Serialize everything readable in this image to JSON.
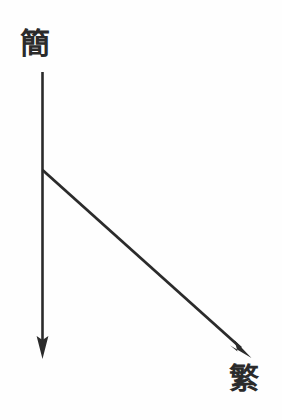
{
  "diagram": {
    "type": "hand-drawn-branching-arrow",
    "background_color": "#fefefe",
    "ink_color": "#2b2b2b",
    "labels": {
      "source": "簡",
      "target": "繁"
    },
    "arrows": [
      {
        "id": "main-vertical-arrow",
        "name": "vertical-arrow",
        "from_label": "簡",
        "start": {
          "x": 42,
          "y": 72
        },
        "end": {
          "x": 42,
          "y": 358
        },
        "direction": "down",
        "head": "filled-triangle"
      },
      {
        "id": "branch-diagonal-arrow",
        "name": "diagonal-arrow",
        "to_label": "繁",
        "start": {
          "x": 42,
          "y": 170
        },
        "end": {
          "x": 250,
          "y": 357
        },
        "direction": "down-right",
        "head": "filled-triangle"
      }
    ],
    "branch_point": {
      "x": 42,
      "y": 170
    }
  }
}
